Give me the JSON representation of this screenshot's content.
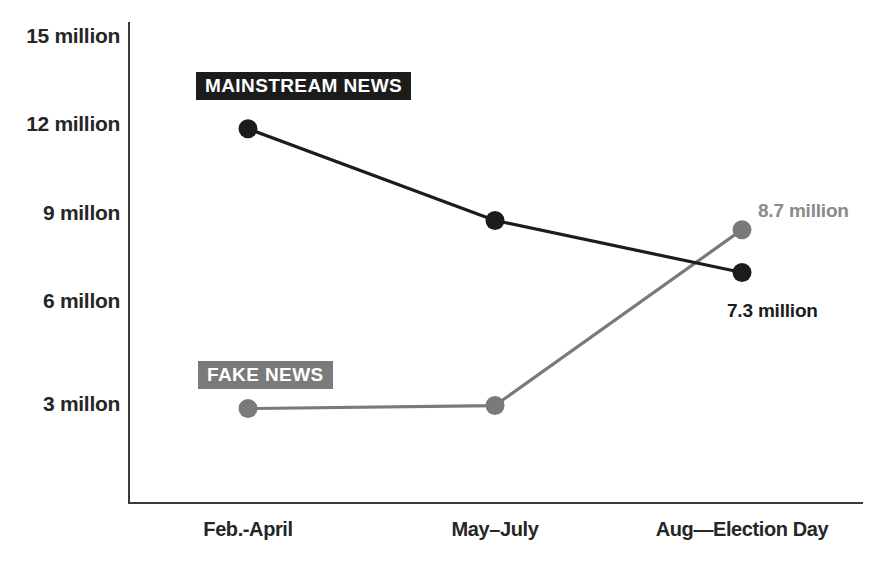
{
  "chart_data": {
    "type": "line",
    "title": "",
    "subtitle": "",
    "xlabel": "",
    "ylabel": "",
    "categories": [
      "Feb.-April",
      "May–July",
      "Aug—Election Day"
    ],
    "ylim": [
      0,
      15
    ],
    "ytick_values": [
      15,
      12,
      9,
      6,
      3
    ],
    "ytick_labels": [
      "15 million",
      "12 million",
      "9 millon",
      "6 millon",
      "3 millon"
    ],
    "grid": false,
    "legend_position": "inline-labels",
    "series": [
      {
        "name": "MAINSTREAM NEWS",
        "color": "#1c1c1c",
        "values": [
          12.0,
          9.0,
          7.3
        ],
        "label_badge": "MAINSTREAM NEWS"
      },
      {
        "name": "FAKE NEWS",
        "color": "#7a7a7a",
        "values": [
          2.85,
          2.95,
          8.7
        ],
        "label_badge": "FAKE NEWS"
      }
    ],
    "annotations": [
      {
        "text": "8.7 million",
        "series": "FAKE NEWS",
        "category": "Aug—Election Day",
        "color": "#8a8a8a"
      },
      {
        "text": "7.3 million",
        "series": "MAINSTREAM NEWS",
        "category": "Aug—Election Day",
        "color": "#1c1c1c"
      }
    ]
  },
  "axes": {
    "y_ticks": [
      {
        "label": "15 million",
        "value": 15
      },
      {
        "label": "12 million",
        "value": 12
      },
      {
        "label": "9 millon",
        "value": 9
      },
      {
        "label": "6 millon",
        "value": 6
      },
      {
        "label": "3 millon",
        "value": 3
      }
    ],
    "x_ticks": [
      {
        "label": "Feb.-April"
      },
      {
        "label": "May–July"
      },
      {
        "label": "Aug—Election Day"
      }
    ],
    "axis_color": "#3b3b3b"
  },
  "badges": {
    "mainstream": "MAINSTREAM NEWS",
    "fake": "FAKE NEWS"
  },
  "annotations": {
    "fake_last": "8.7 million",
    "mainstream_last": "7.3 million"
  },
  "colors": {
    "mainstream": "#1c1c1c",
    "fake": "#7a7a7a",
    "annotation_fake": "#8a8a8a",
    "annotation_mainstream": "#1c1c1c",
    "axis": "#3b3b3b",
    "background": "#ffffff",
    "tick_text": "#262626"
  }
}
